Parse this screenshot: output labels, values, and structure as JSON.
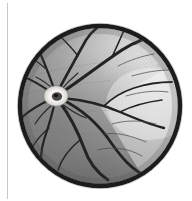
{
  "page": {
    "background_color": "#ffffff",
    "margin_rule": {
      "name": "left-margin-rule",
      "color": "#c8c8c8"
    }
  },
  "figure": {
    "title": "Ophthalmoscopic view of the human ocular fundus",
    "medium": "grayscale halftone illustration",
    "rim": {
      "label": "field-of-view rim",
      "color": "#1c1c1c"
    },
    "circle": {
      "center_x": 100,
      "center_y": 106,
      "radius": 81
    },
    "annotation": {
      "signature_mark": "ill.",
      "color": "#a9a9a9"
    },
    "regions": [
      {
        "name": "optic-disc",
        "label": "Optic disc",
        "tone": "#f2f0ec",
        "cx": 56,
        "cy": 96
      },
      {
        "name": "optic-cup",
        "label": "Optic cup",
        "tone": "#2b2b2b",
        "cx": 57,
        "cy": 97
      },
      {
        "name": "nasal-retina",
        "label": "Nasal retina",
        "tone": "#8d8d8d"
      },
      {
        "name": "temporal-retina",
        "label": "Temporal retina",
        "tone": "#f4f4f4"
      },
      {
        "name": "macula",
        "label": "Macular area",
        "tone": "#e9e9e9"
      },
      {
        "name": "inferior-retina",
        "label": "Inferior retina",
        "tone": "#6f6f6f"
      }
    ],
    "vessels": {
      "label": "Retinal blood vessels",
      "color": "#232323",
      "count_major": 9,
      "description": "Arteries and veins radiating from the optic disc"
    },
    "tones": {
      "vessel": "#232323",
      "rim": "#1c1c1c",
      "retina_dark": "#6a6a6a",
      "retina_mid": "#9a9a9a",
      "retina_light": "#f6f6f6",
      "disc_bright": "#f7f5f1"
    }
  }
}
